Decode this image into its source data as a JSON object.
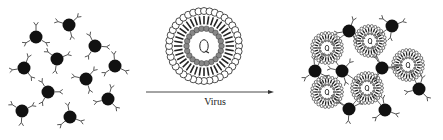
{
  "diagram": {
    "type": "schematic",
    "arrow_label": "Virus",
    "colors": {
      "particle": "#111111",
      "antibody": "#555555",
      "virus_shell": "#222222",
      "virus_inner": "#888888",
      "background": "#ffffff"
    },
    "left_panel": {
      "label": "Free antibody-coated particles",
      "particles": [
        {
          "x": 36,
          "y": 37
        },
        {
          "x": 69,
          "y": 25
        },
        {
          "x": 95,
          "y": 46
        },
        {
          "x": 24,
          "y": 68
        },
        {
          "x": 57,
          "y": 59
        },
        {
          "x": 115,
          "y": 66
        },
        {
          "x": 86,
          "y": 79
        },
        {
          "x": 48,
          "y": 92
        },
        {
          "x": 108,
          "y": 99
        },
        {
          "x": 22,
          "y": 111
        },
        {
          "x": 70,
          "y": 117
        }
      ]
    },
    "center_panel": {
      "virus_center": {
        "x": 64,
        "y": 46
      },
      "arrow": {
        "x1": 6,
        "x2": 134,
        "y": 92
      }
    },
    "right_panel": {
      "label": "Agglutinated complex",
      "particles": [
        {
          "x": 59,
          "y": 31
        },
        {
          "x": 102,
          "y": 26
        },
        {
          "x": 25,
          "y": 71
        },
        {
          "x": 52,
          "y": 71
        },
        {
          "x": 92,
          "y": 68
        },
        {
          "x": 129,
          "y": 89
        },
        {
          "x": 59,
          "y": 109
        },
        {
          "x": 95,
          "y": 110
        }
      ],
      "viruses": [
        {
          "x": 37,
          "y": 48
        },
        {
          "x": 80,
          "y": 41
        },
        {
          "x": 118,
          "y": 65
        },
        {
          "x": 37,
          "y": 92
        },
        {
          "x": 77,
          "y": 88
        }
      ]
    }
  }
}
